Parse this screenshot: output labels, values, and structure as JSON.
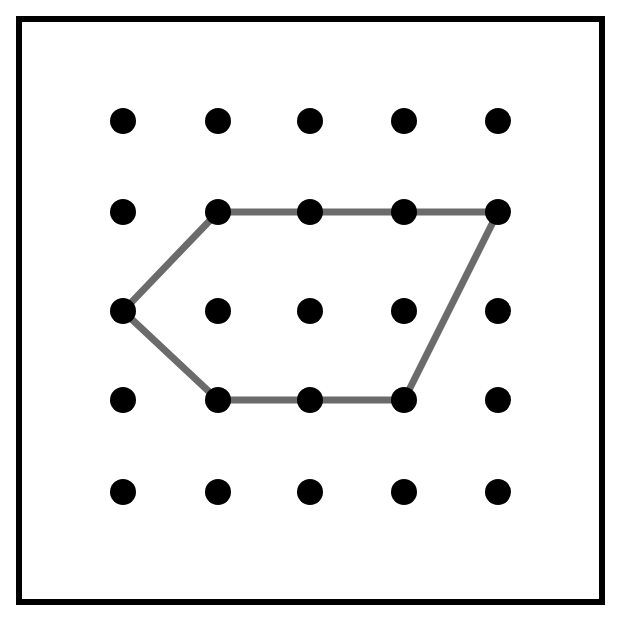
{
  "figure": {
    "canvas": {
      "width": 619,
      "height": 617
    },
    "background_color": "#ffffff"
  },
  "frame": {
    "name": "outer-border",
    "x": 16,
    "y": 16,
    "width": 589,
    "height": 589,
    "stroke_color": "#000000",
    "stroke_width": 6
  },
  "chart_data": {
    "type": "scatter",
    "xlabel": "",
    "ylabel": "",
    "grid": false,
    "legend": "none",
    "xlim": [
      0,
      4
    ],
    "ylim": [
      0,
      4
    ],
    "grid_dots": {
      "rows": 5,
      "cols": 5,
      "count": 25,
      "dot_color": "#000000",
      "dot_radius": 13,
      "col_x": [
        123,
        218,
        310,
        404,
        498
      ],
      "row_y": [
        121,
        212,
        311,
        400,
        492
      ],
      "points": [
        {
          "col": 0,
          "row": 0,
          "x": 123,
          "y": 121
        },
        {
          "col": 1,
          "row": 0,
          "x": 218,
          "y": 121
        },
        {
          "col": 2,
          "row": 0,
          "x": 310,
          "y": 121
        },
        {
          "col": 3,
          "row": 0,
          "x": 404,
          "y": 121
        },
        {
          "col": 4,
          "row": 0,
          "x": 498,
          "y": 121
        },
        {
          "col": 0,
          "row": 1,
          "x": 123,
          "y": 212
        },
        {
          "col": 1,
          "row": 1,
          "x": 218,
          "y": 212
        },
        {
          "col": 2,
          "row": 1,
          "x": 310,
          "y": 212
        },
        {
          "col": 3,
          "row": 1,
          "x": 404,
          "y": 212
        },
        {
          "col": 4,
          "row": 1,
          "x": 498,
          "y": 212
        },
        {
          "col": 0,
          "row": 2,
          "x": 123,
          "y": 311
        },
        {
          "col": 1,
          "row": 2,
          "x": 218,
          "y": 311
        },
        {
          "col": 2,
          "row": 2,
          "x": 310,
          "y": 311
        },
        {
          "col": 3,
          "row": 2,
          "x": 404,
          "y": 311
        },
        {
          "col": 4,
          "row": 2,
          "x": 498,
          "y": 311
        },
        {
          "col": 0,
          "row": 3,
          "x": 123,
          "y": 400
        },
        {
          "col": 1,
          "row": 3,
          "x": 218,
          "y": 400
        },
        {
          "col": 2,
          "row": 3,
          "x": 310,
          "y": 400
        },
        {
          "col": 3,
          "row": 3,
          "x": 404,
          "y": 400
        },
        {
          "col": 4,
          "row": 3,
          "x": 498,
          "y": 400
        },
        {
          "col": 0,
          "row": 4,
          "x": 123,
          "y": 492
        },
        {
          "col": 1,
          "row": 4,
          "x": 218,
          "y": 492
        },
        {
          "col": 2,
          "row": 4,
          "x": 310,
          "y": 492
        },
        {
          "col": 3,
          "row": 4,
          "x": 404,
          "y": 492
        },
        {
          "col": 4,
          "row": 4,
          "x": 498,
          "y": 492
        }
      ]
    },
    "polygon": {
      "name": "gray-polygon",
      "sides": 6,
      "closed": true,
      "stroke_color": "#6b6b6b",
      "stroke_width": 7,
      "fill": "none",
      "vertices": [
        {
          "label": "top-left",
          "col": 1,
          "row": 1,
          "x": 218,
          "y": 212
        },
        {
          "label": "top-right",
          "col": 4,
          "row": 1,
          "x": 498,
          "y": 212
        },
        {
          "label": "bottom-right",
          "col": 3,
          "row": 3,
          "x": 404,
          "y": 400
        },
        {
          "label": "bottom-left",
          "col": 1,
          "row": 3,
          "x": 218,
          "y": 400
        },
        {
          "label": "left-point",
          "col": 0,
          "row": 2,
          "x": 123,
          "y": 311
        }
      ],
      "path_points": "218,212 498,212 404,400 218,400 123,311",
      "edges": [
        {
          "from": "top-left",
          "to": "top-right",
          "orientation": "horizontal"
        },
        {
          "from": "top-right",
          "to": "bottom-right",
          "orientation": "diagonal"
        },
        {
          "from": "bottom-right",
          "to": "bottom-left",
          "orientation": "horizontal"
        },
        {
          "from": "bottom-left",
          "to": "left-point",
          "orientation": "diagonal"
        },
        {
          "from": "left-point",
          "to": "top-left",
          "orientation": "diagonal"
        }
      ],
      "points_on_edges": [
        {
          "x": 310,
          "y": 212
        },
        {
          "x": 404,
          "y": 212
        },
        {
          "x": 310,
          "y": 400
        }
      ]
    }
  }
}
